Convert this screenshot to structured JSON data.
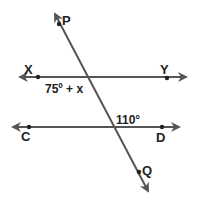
{
  "diagram": {
    "type": "parallel-lines-transversal",
    "colors": {
      "line": "#555555",
      "text": "#222222",
      "background": "#ffffff"
    },
    "lines": [
      {
        "id": "XY",
        "x1": 20,
        "y1": 77,
        "x2": 186,
        "y2": 77,
        "arrows": "both"
      },
      {
        "id": "CD",
        "x1": 13,
        "y1": 127,
        "x2": 179,
        "y2": 127,
        "arrows": "both"
      },
      {
        "id": "PQ",
        "x1": 55,
        "y1": 14,
        "x2": 148,
        "y2": 191,
        "arrows": "both"
      }
    ],
    "points": [
      {
        "name": "P",
        "x": 59,
        "y": 24,
        "label": "P",
        "lx": 62,
        "ly": 25
      },
      {
        "name": "X",
        "x": 38,
        "y": 77,
        "label": "X",
        "lx": 24,
        "ly": 74
      },
      {
        "name": "Y",
        "x": 167,
        "y": 78,
        "label": "Y",
        "lx": 160,
        "ly": 74
      },
      {
        "name": "C",
        "x": 29,
        "y": 127,
        "label": "C",
        "lx": 21,
        "ly": 141
      },
      {
        "name": "D",
        "x": 162,
        "y": 127,
        "label": "D",
        "lx": 156,
        "ly": 142
      },
      {
        "name": "Q",
        "x": 139,
        "y": 172,
        "label": "Q",
        "lx": 142,
        "ly": 175
      }
    ],
    "angles": [
      {
        "label": "75º + x",
        "x": 45,
        "y": 93
      },
      {
        "label": "110°",
        "x": 116,
        "y": 124
      }
    ]
  }
}
